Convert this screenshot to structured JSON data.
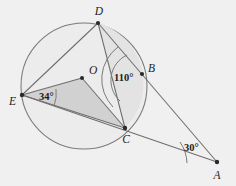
{
  "figure": {
    "kind": "circle-geometry-diagram",
    "background_color": "#f0f0f0",
    "stroke_color": "#6e6e6e",
    "circle_fill": "#ececec",
    "segment_fill": "#e2e2e2",
    "triangle_fill": "#d2d2d2",
    "label_color": "#1c1c1c"
  },
  "circle": {
    "name": "circle-O",
    "center_x": 84,
    "center_y": 86,
    "radius": 63
  },
  "points": [
    {
      "id": "D",
      "label": "D",
      "x": 98,
      "y": 23,
      "label_x": 99,
      "label_y": 15,
      "on_circle": true
    },
    {
      "id": "O",
      "label": "O",
      "x": 82,
      "y": 78,
      "label_x": 89,
      "label_y": 74,
      "on_circle": false
    },
    {
      "id": "B",
      "label": "B",
      "x": 142,
      "y": 74,
      "label_x": 149,
      "label_y": 72,
      "on_circle": true
    },
    {
      "id": "E",
      "label": "E",
      "x": 22,
      "y": 95,
      "label_x": 10,
      "label_y": 104,
      "on_circle": true
    },
    {
      "id": "C",
      "label": "C",
      "x": 125,
      "y": 128,
      "label_x": 126,
      "label_y": 142,
      "on_circle": true
    },
    {
      "id": "A",
      "label": "A",
      "x": 217,
      "y": 162,
      "label_x": 216,
      "label_y": 178,
      "on_circle": false
    }
  ],
  "angles": [
    {
      "id": "angle-E",
      "label": "34°",
      "vertex": "E",
      "label_x": 39,
      "label_y": 99
    },
    {
      "id": "angle-B",
      "label": "110°",
      "vertex": "B",
      "label_x": 115,
      "label_y": 80
    },
    {
      "id": "angle-A",
      "label": "30°",
      "vertex": "A",
      "label_x": 184,
      "label_y": 150
    }
  ],
  "segments": [
    {
      "id": "seg-DE",
      "from": "D",
      "to": "E"
    },
    {
      "id": "seg-DA",
      "from": "D",
      "to": "A"
    },
    {
      "id": "seg-DC",
      "from": "D",
      "to": "C"
    },
    {
      "id": "seg-EO",
      "from": "E",
      "to": "O"
    },
    {
      "id": "seg-OC",
      "from": "O",
      "to": "C"
    },
    {
      "id": "seg-EA",
      "from": "E",
      "to": "A"
    },
    {
      "id": "seg-EC",
      "from": "E",
      "to": "C"
    },
    {
      "id": "seg-BC",
      "from": "B",
      "to": "C"
    }
  ]
}
